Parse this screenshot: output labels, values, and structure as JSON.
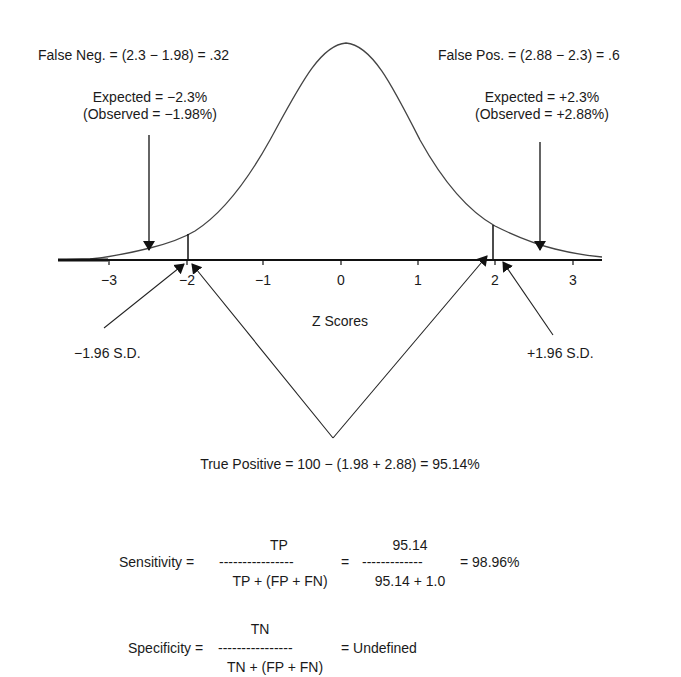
{
  "annotations": {
    "false_negative": "False Neg. = (2.3 − 1.98) = .32",
    "false_positive": "False Pos. = (2.88 − 2.3) = .6",
    "left_expected": "Expected = −2.3%",
    "left_observed": "(Observed = −1.98%)",
    "right_expected": "Expected = +2.3%",
    "right_observed": "(Observed = +2.88%)",
    "left_sd": "−1.96 S.D.",
    "right_sd": "+1.96 S.D.",
    "axis_label": "Z Scores",
    "true_positive": "True Positive = 100 − (1.98 + 2.88) = 95.14%"
  },
  "axis": {
    "ticks": [
      "−3",
      "−2",
      "−1",
      "0",
      "1",
      "2",
      "3"
    ],
    "values": [
      -3,
      -2,
      -1,
      0,
      1,
      2,
      3
    ],
    "cutoffs": [
      -1.96,
      1.96
    ]
  },
  "formulas": {
    "sensitivity": {
      "label": "Sensitivity =",
      "numerator": "TP",
      "denominator": "TP + (FP + FN)",
      "dashes": "----------------",
      "equals": "=",
      "numerator_value": "95.14",
      "denominator_value": "95.14 + 1.0",
      "dashes_value": "-------------",
      "result": "= 98.96%"
    },
    "specificity": {
      "label": "Specificity =",
      "numerator": "TN",
      "denominator": "TN + (FP + FN)",
      "dashes": "----------------",
      "result": "= Undefined"
    }
  },
  "colors": {
    "line": "#333333",
    "text": "#1a1a1a",
    "background": "#ffffff"
  }
}
